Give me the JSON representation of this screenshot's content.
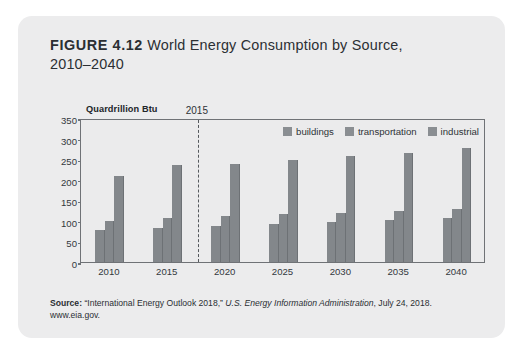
{
  "figure": {
    "number": "FIGURE 4.12",
    "title": "World Energy Consumption by Source,",
    "title_line2": "2010–2040"
  },
  "source": {
    "label": "Source:",
    "publication": "“International Energy Outlook 2018,”",
    "organization": "U.S. Energy Information Administration",
    "date": ", July 24, 2018.",
    "url": "www.eia.gov."
  },
  "legend": {
    "position": "top-right",
    "items": [
      {
        "label": "buildings",
        "color": "#8a8e92"
      },
      {
        "label": "transportation",
        "color": "#8a8e92"
      },
      {
        "label": "industrial",
        "color": "#8a8e92"
      }
    ]
  },
  "annotation": {
    "marker_label": "2015"
  },
  "chart_data": {
    "type": "bar",
    "title": "World Energy Consumption by Source, 2010–2040",
    "xlabel": "",
    "ylabel": "Quardrillion Btu",
    "categories": [
      "2010",
      "2015",
      "2020",
      "2025",
      "2030",
      "2035",
      "2040"
    ],
    "series": [
      {
        "name": "buildings",
        "values": [
          78,
          82,
          88,
          92,
          98,
          103,
          108
        ]
      },
      {
        "name": "transportation",
        "values": [
          100,
          107,
          112,
          117,
          120,
          124,
          128
        ]
      },
      {
        "name": "industrial",
        "values": [
          210,
          235,
          238,
          248,
          258,
          265,
          277
        ]
      }
    ],
    "ylim": [
      0,
      350
    ],
    "yticks": [
      0,
      50,
      100,
      150,
      200,
      250,
      300,
      350
    ],
    "ytick_labels": [
      "0",
      "50",
      "100",
      "150",
      "200",
      "250",
      "300",
      "350"
    ],
    "grid": false,
    "legend_position": "top-right",
    "annotations": [
      {
        "type": "vline",
        "label": "2015",
        "between": [
          "2015",
          "2020"
        ],
        "style": "dashed"
      }
    ]
  }
}
